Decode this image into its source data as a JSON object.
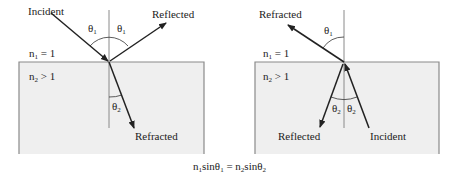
{
  "colors": {
    "medium_fill": "#efefef",
    "medium_border": "#8a8a8a",
    "line": "#222222",
    "normal_line": "#8a8a8a"
  },
  "left_diagram": {
    "labels": {
      "incident": "Incident",
      "reflected": "Reflected",
      "refracted": "Refracted",
      "n1_base": "n",
      "n1_sub": "1",
      "n1_rel": " = 1",
      "n2_base": "n",
      "n2_sub": "2",
      "n2_rel": " > 1",
      "theta1_a_base": "θ",
      "theta1_a_sub": "1",
      "theta1_b_base": "θ",
      "theta1_b_sub": "1",
      "theta2_base": "θ",
      "theta2_sub": "2"
    }
  },
  "right_diagram": {
    "labels": {
      "refracted": "Refracted",
      "reflected": "Reflected",
      "incident": "Incident",
      "n1_base": "n",
      "n1_sub": "1",
      "n1_rel": " = 1",
      "n2_base": "n",
      "n2_sub": "2",
      "n2_rel": " > 1",
      "theta1_base": "θ",
      "theta1_sub": "1",
      "theta2_a_base": "θ",
      "theta2_a_sub": "2",
      "theta2_b_base": "θ",
      "theta2_b_sub": "2"
    }
  },
  "equation": {
    "n1": "n",
    "n1_sub": "1",
    "sin1": "sinθ",
    "sin1_sub": "1",
    "equals": " = ",
    "n2": "n",
    "n2_sub": "2",
    "sin2": "sinθ",
    "sin2_sub": "2"
  }
}
